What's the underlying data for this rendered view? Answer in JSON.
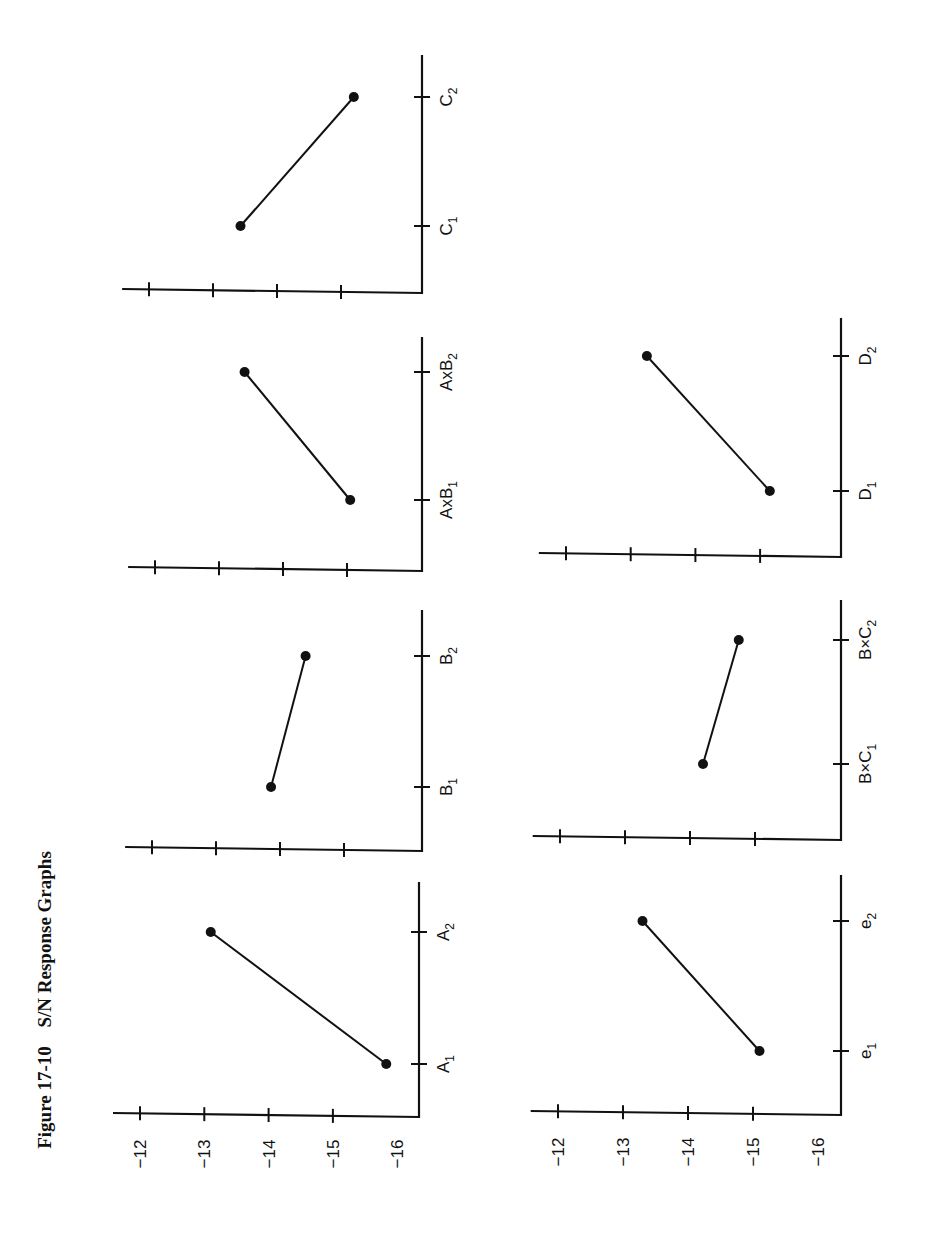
{
  "figure": {
    "label": "Figure 17-10",
    "title": "S/N Response Graphs"
  },
  "chart_data": [
    {
      "type": "line",
      "title": "Factor A",
      "categories": [
        "A1",
        "A2"
      ],
      "values": [
        -15.8,
        -13.1
      ],
      "ylabel": "S/N",
      "yticks": [
        -12,
        -13,
        -14,
        -15,
        -16
      ],
      "ylim": [
        -16,
        -12
      ],
      "grid": false
    },
    {
      "type": "line",
      "title": "Factor B",
      "categories": [
        "B1",
        "B2"
      ],
      "values": [
        -13.9,
        -14.4
      ],
      "yticks": [
        -12,
        -13,
        -14,
        -15,
        -16
      ],
      "ylim": [
        -16,
        -12
      ],
      "grid": false
    },
    {
      "type": "line",
      "title": "Interaction AxB",
      "categories": [
        "AxB1",
        "AxB2"
      ],
      "values": [
        -15.1,
        -13.4
      ],
      "yticks": [
        -12,
        -13,
        -14,
        -15,
        -16
      ],
      "ylim": [
        -16,
        -12
      ],
      "grid": false
    },
    {
      "type": "line",
      "title": "Factor C",
      "categories": [
        "C1",
        "C2"
      ],
      "values": [
        -13.4,
        -15.2
      ],
      "yticks": [
        -12,
        -13,
        -14,
        -15,
        -16
      ],
      "ylim": [
        -16,
        -12
      ],
      "grid": false
    },
    {
      "type": "line",
      "title": "Error e",
      "categories": [
        "e1",
        "e2"
      ],
      "values": [
        -15.1,
        -13.3
      ],
      "ylabel": "S/N",
      "yticks": [
        -12,
        -13,
        -14,
        -15,
        -16
      ],
      "ylim": [
        -16,
        -12
      ],
      "grid": false
    },
    {
      "type": "line",
      "title": "Interaction BxC",
      "categories": [
        "BxC1",
        "BxC2"
      ],
      "values": [
        -14.2,
        -14.8
      ],
      "yticks": [
        -12,
        -13,
        -14,
        -15,
        -16
      ],
      "ylim": [
        -16,
        -12
      ],
      "grid": false
    },
    {
      "type": "line",
      "title": "Factor D",
      "categories": [
        "D1",
        "D2"
      ],
      "values": [
        -15.2,
        -13.3
      ],
      "yticks": [
        -12,
        -13,
        -14,
        -15,
        -16
      ],
      "ylim": [
        -16,
        -12
      ],
      "grid": false
    }
  ],
  "panels": [
    {
      "id": "A",
      "base": 1117,
      "axis_x": 419,
      "top": 882,
      "t12": 140,
      "step": 64.3,
      "ticks_y": [
        1064,
        932
      ],
      "labels": [
        {
          "main": "A",
          "sub": "1"
        },
        {
          "main": "A",
          "sub": "2"
        }
      ],
      "values": [
        -15.83,
        -13.1
      ],
      "show_tick_labels": true
    },
    {
      "id": "B",
      "base": 851,
      "axis_x": 422,
      "top": 610,
      "t12": 152,
      "step": 64,
      "ticks_y": [
        787,
        656
      ],
      "labels": [
        {
          "main": "B",
          "sub": "1"
        },
        {
          "main": "B",
          "sub": "2"
        }
      ],
      "values": [
        -13.86,
        -14.4
      ],
      "show_tick_labels": false
    },
    {
      "id": "AxB",
      "base": 571,
      "axis_x": 422,
      "top": 337,
      "t12": 155,
      "step": 64,
      "ticks_y": [
        500,
        372
      ],
      "labels": [
        {
          "main": "AxB",
          "sub": "1"
        },
        {
          "main": "AxB",
          "sub": "2"
        }
      ],
      "values": [
        -15.05,
        -13.4
      ],
      "show_tick_labels": false
    },
    {
      "id": "C",
      "base": 293,
      "axis_x": 422,
      "top": 55,
      "t12": 149,
      "step": 64,
      "ticks_y": [
        226,
        97
      ],
      "labels": [
        {
          "main": "C",
          "sub": "1"
        },
        {
          "main": "C",
          "sub": "2"
        }
      ],
      "values": [
        -13.43,
        -15.2
      ],
      "show_tick_labels": false
    },
    {
      "id": "e",
      "base": 1115,
      "axis_x": 841,
      "top": 875,
      "t12": 558,
      "step": 65,
      "ticks_y": [
        1051,
        921
      ],
      "labels": [
        {
          "main": "e",
          "sub": "1"
        },
        {
          "main": "e",
          "sub": "2"
        }
      ],
      "values": [
        -15.1,
        -13.3
      ],
      "show_tick_labels": true
    },
    {
      "id": "BxC",
      "base": 840,
      "axis_x": 841,
      "top": 600,
      "t12": 560,
      "step": 65,
      "ticks_y": [
        764,
        640
      ],
      "labels": [
        {
          "main": "B×C",
          "sub": "1"
        },
        {
          "main": "B×C",
          "sub": "2"
        }
      ],
      "values": [
        -14.2,
        -14.75
      ],
      "show_tick_labels": false
    },
    {
      "id": "D",
      "base": 557,
      "axis_x": 841,
      "top": 318,
      "t12": 566,
      "step": 64.7,
      "ticks_y": [
        491,
        356
      ],
      "labels": [
        {
          "main": "D",
          "sub": "1"
        },
        {
          "main": "D",
          "sub": "2"
        }
      ],
      "values": [
        -15.15,
        -13.25
      ],
      "show_tick_labels": false
    }
  ],
  "y_tick_labels": [
    "−12",
    "−13",
    "−14",
    "−15",
    "−16"
  ],
  "colors": {
    "ink": "#111111",
    "background": "#ffffff"
  }
}
